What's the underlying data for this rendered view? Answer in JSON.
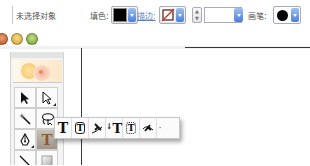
{
  "control_bar": {
    "selection_status": "未选择对象",
    "fill_label": "填色:",
    "fill_color": "#000000",
    "stroke_label": "描边:",
    "stroke_value": "none",
    "stroke_weight_value": "",
    "brush_label": "画笔:",
    "brush_value": "basic-round"
  },
  "window": {
    "traffic_lights": [
      "close",
      "minimize",
      "zoom"
    ]
  },
  "tools_panel": {
    "logo_icon": "flower-logo",
    "tools": [
      {
        "name": "selection-tool",
        "glyph": "arrow"
      },
      {
        "name": "direct-selection-tool",
        "glyph": "hollow-arrow",
        "has_flyout": true
      },
      {
        "name": "magic-wand-tool",
        "glyph": "wand"
      },
      {
        "name": "lasso-tool",
        "glyph": "lasso"
      },
      {
        "name": "pen-tool",
        "glyph": "pen",
        "has_flyout": true
      },
      {
        "name": "type-tool",
        "glyph": "T",
        "active": true
      },
      {
        "name": "line-segment-tool",
        "glyph": "line",
        "has_flyout": true
      },
      {
        "name": "rectangle-tool",
        "glyph": "rect",
        "has_flyout": true
      }
    ]
  },
  "type_flyout": {
    "items": [
      {
        "name": "type-tool",
        "glyph": "T"
      },
      {
        "name": "area-type-tool",
        "glyph": "T"
      },
      {
        "name": "type-on-path-tool",
        "glyph": "path-T"
      },
      {
        "name": "vertical-type-tool",
        "glyph": "↓T"
      },
      {
        "name": "vertical-area-type-tool",
        "glyph": "T"
      },
      {
        "name": "vertical-type-on-path-tool",
        "glyph": "path-T"
      }
    ],
    "tearoff": "·"
  }
}
